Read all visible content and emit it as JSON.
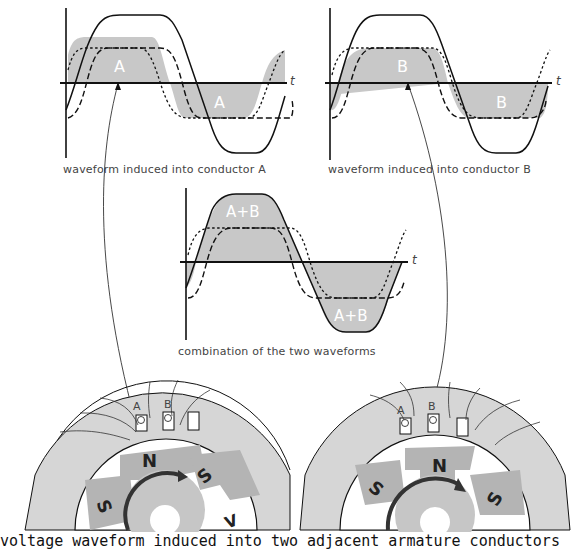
{
  "figure": {
    "caption": "voltage waveform induced into two adjacent armature conductors",
    "colors": {
      "fill": "#c8c8c8",
      "stroke": "#111111",
      "background": "#ffffff",
      "iron": "#d6d6d6",
      "pole": "#b4b4b4"
    }
  },
  "graphs": {
    "a": {
      "label": "waveform induced into conductor A",
      "region_label_pos": "A",
      "region_label_neg": "A",
      "axis_label": "t"
    },
    "b": {
      "label": "waveform induced into conductor B",
      "region_label_pos": "B",
      "region_label_neg": "B",
      "axis_label": "t"
    },
    "sum": {
      "label": "combination of the two waveforms",
      "region_label_pos": "A+B",
      "region_label_neg": "A+B",
      "axis_label": "t"
    }
  },
  "machines": {
    "left": {
      "conductor_a": "A",
      "conductor_b": "B",
      "poles": [
        "N",
        "S",
        "S",
        "V"
      ]
    },
    "right": {
      "conductor_a": "A",
      "conductor_b": "B",
      "poles": [
        "N",
        "S",
        "S"
      ]
    }
  }
}
